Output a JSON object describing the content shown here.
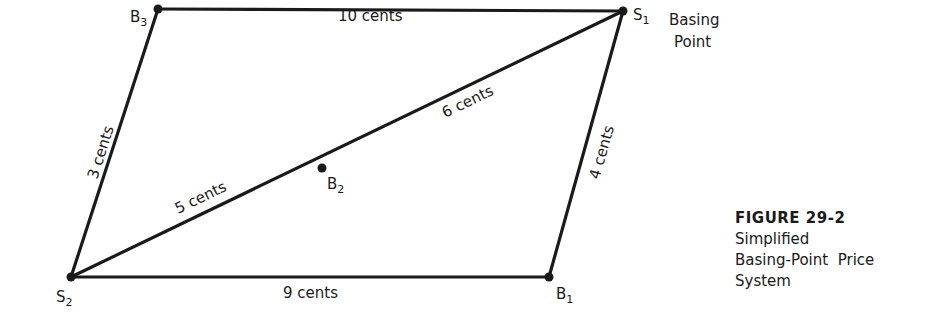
{
  "nodes": [
    {
      "id": "B3",
      "base": "B",
      "sub": "3",
      "x": 158,
      "y": 9
    },
    {
      "id": "S1",
      "base": "S",
      "sub": "1",
      "x": 623,
      "y": 11
    },
    {
      "id": "S2",
      "base": "S",
      "sub": "2",
      "x": 71,
      "y": 277
    },
    {
      "id": "B1",
      "base": "B",
      "sub": "1",
      "x": 549,
      "y": 277
    },
    {
      "id": "B2",
      "base": "B",
      "sub": "2",
      "x": 322,
      "y": 168
    }
  ],
  "edges": [
    {
      "from": "B3",
      "to": "S1",
      "label": "10 cents"
    },
    {
      "from": "S2",
      "to": "B3",
      "label": "3 cents"
    },
    {
      "from": "S2",
      "to": "B2",
      "label": "5 cents"
    },
    {
      "from": "B2",
      "to": "S1",
      "label": "6 cents"
    },
    {
      "from": "B1",
      "to": "S1",
      "label": "4 cents"
    },
    {
      "from": "S2",
      "to": "B1",
      "label": "9 cents"
    }
  ],
  "annotation": {
    "line1": "Basing",
    "line2": "Point"
  },
  "caption": {
    "figure": "FIGURE 29-2",
    "line1": "Simplified",
    "line2": "Basing-Point  Price",
    "line3": "System"
  }
}
